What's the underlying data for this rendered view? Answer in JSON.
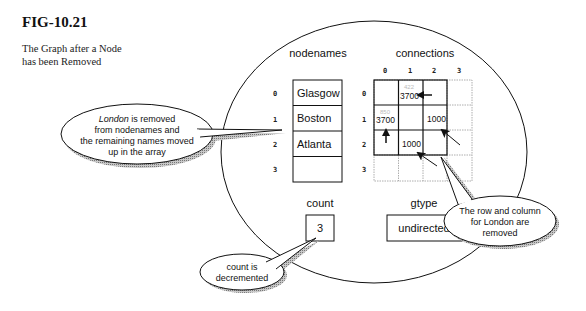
{
  "figure": {
    "id": "FIG-10.21",
    "caption_line1": "The Graph after a Node",
    "caption_line2": "has been Removed"
  },
  "nodenames": {
    "label": "nodenames",
    "indices": [
      "0",
      "1",
      "2",
      "3"
    ],
    "values": [
      "Glasgow",
      "Boston",
      "Atlanta",
      ""
    ]
  },
  "connections": {
    "label": "connections",
    "col_indices": [
      "0",
      "1",
      "2",
      "3"
    ],
    "row_indices": [
      "0",
      "1",
      "2",
      "3"
    ],
    "matrix": [
      [
        "",
        "3700",
        "",
        ""
      ],
      [
        "3700",
        "",
        "1000",
        ""
      ],
      [
        "",
        "1000",
        "",
        ""
      ],
      [
        "",
        "",
        "",
        ""
      ]
    ],
    "ghost_values": {
      "r0c1": "422",
      "r1c0": "850"
    }
  },
  "count": {
    "label": "count",
    "value": "3"
  },
  "gtype": {
    "label": "gtype",
    "value": "undirected"
  },
  "callouts": {
    "nodenames": {
      "line1_italic": "London",
      "line1_rest": " is removed",
      "line2": "from nodenames and",
      "line3": "the remaining names moved",
      "line4": "up in the array"
    },
    "count": {
      "line1": "count is",
      "line2": "decremented"
    },
    "connections": {
      "line1": "The row and column",
      "line2": "for London are",
      "line3": "removed"
    }
  },
  "colors": {
    "stroke": "#111111",
    "shadow": "#9a9a9a",
    "dotted": "#999999",
    "background": "#ffffff"
  }
}
